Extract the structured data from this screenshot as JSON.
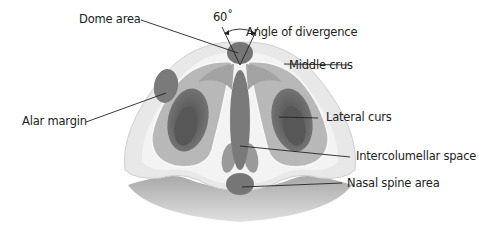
{
  "diagram": {
    "angle_label": "60˚",
    "labels": {
      "dome_area": "Dome area",
      "angle_of_divergence": "Angle of divergence",
      "middle_crus": "Middle crus",
      "alar_margin": "Alar margin",
      "lateral_curs": "Lateral curs",
      "intercolumellar_space": "Intercolumellar space",
      "nasal_spine_area": "Nasal spine area"
    },
    "colors": {
      "outer_skin": "#e6e6e6",
      "inner_skin": "#f2f2f2",
      "cartilage_light": "#b5b5b5",
      "cartilage_mid": "#8e8e8e",
      "structure_dark": "#6e6e6e",
      "nostril_dark": "#555555",
      "lip": "#b0b0b0",
      "leader_line": "#222222"
    }
  }
}
